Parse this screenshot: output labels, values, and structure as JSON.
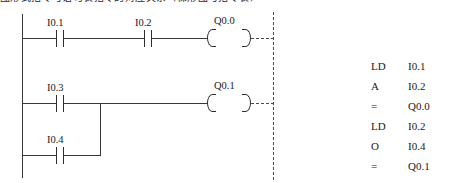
{
  "caption": {
    "text": "图形式指令与语句表指令的对应关系（梯形图与指令表）"
  },
  "ladder": {
    "left_rail": "power-rail-left",
    "right_rail": "power-rail-right-dashed",
    "rungs": [
      {
        "id": "rung-1",
        "contacts": [
          {
            "label": "I0.1",
            "type": "no-contact"
          },
          {
            "label": "I0.2",
            "type": "no-contact"
          }
        ],
        "coil": {
          "label": "Q0.0",
          "type": "output-coil"
        }
      },
      {
        "id": "rung-2",
        "contacts": [
          {
            "label": "I0.3",
            "type": "no-contact"
          }
        ],
        "coil": {
          "label": "Q0.1",
          "type": "output-coil"
        }
      },
      {
        "id": "rung-3-branch",
        "contacts": [
          {
            "label": "I0.4",
            "type": "no-contact"
          }
        ],
        "coil": null
      }
    ]
  },
  "instruction_list": {
    "rows": [
      {
        "op": "LD",
        "arg": "I0.1"
      },
      {
        "op": "A",
        "arg": "I0.2"
      },
      {
        "op": "=",
        "arg": "Q0.0"
      },
      {
        "op": "LD",
        "arg": "I0.2"
      },
      {
        "op": "O",
        "arg": "I0.4"
      },
      {
        "op": "=",
        "arg": "Q0.1"
      }
    ]
  },
  "colors": {
    "line": "#3a3a3a",
    "text": "#1a1a1a",
    "background": "#ffffff"
  }
}
